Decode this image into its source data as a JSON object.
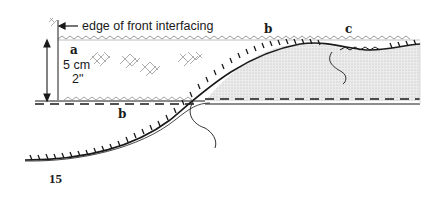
{
  "figure": {
    "number": "15",
    "labels": {
      "edge_note": "edge of front interfacing",
      "a": "a",
      "b_top": "b",
      "b_bottom": "b",
      "c": "c",
      "measure_cm": "5 cm",
      "measure_in": "2\""
    },
    "colors": {
      "ink": "#1a1a1a",
      "shaded_fill": "#d9d9d9",
      "hatch": "#8a8a8a",
      "background": "#ffffff"
    }
  }
}
